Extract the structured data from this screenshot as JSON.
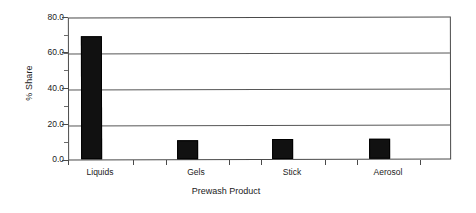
{
  "chart_data": {
    "type": "bar",
    "title": "",
    "xlabel": "Prewash Product",
    "ylabel": "% Share",
    "categories": [
      "Liquids",
      "Gels",
      "Stick",
      "Aerosol"
    ],
    "values": [
      70.0,
      11.0,
      11.5,
      11.5
    ],
    "ylim": [
      0.0,
      80.0
    ],
    "yticks": [
      "0.0",
      "20.0",
      "40.0",
      "60.0",
      "80.0"
    ],
    "ytick_values": [
      0.0,
      20.0,
      40.0,
      60.0,
      80.0
    ],
    "yminor_ticks": [
      10.0,
      30.0,
      50.0,
      70.0
    ],
    "grid": true,
    "grid_axis": "y",
    "legend": false,
    "bar_color": "#111111",
    "axis_color": "#4a4a4a",
    "background": "#ffffff"
  }
}
